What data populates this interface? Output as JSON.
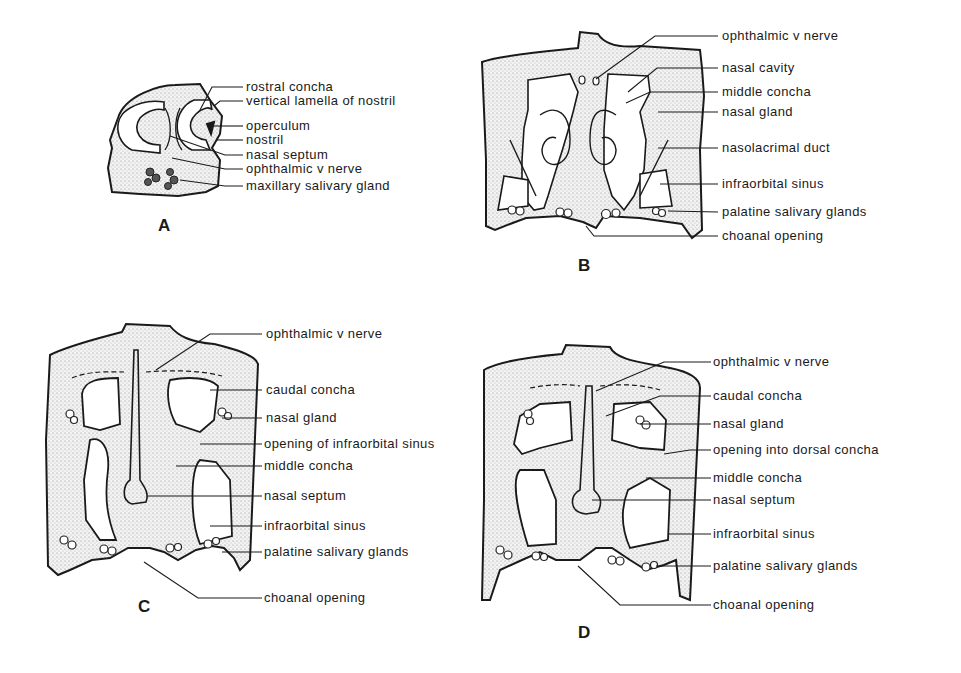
{
  "figure": {
    "panels": [
      {
        "id": "A",
        "letter": "A",
        "labels": [
          "rostral concha",
          "vertical lamella of nostril",
          "operculum",
          "nostril",
          "nasal septum",
          "ophthalmic v nerve",
          "maxillary salivary gland"
        ]
      },
      {
        "id": "B",
        "letter": "B",
        "labels": [
          "ophthalmic v nerve",
          "nasal cavity",
          "middle concha",
          "nasal gland",
          "nasolacrimal duct",
          "infraorbital sinus",
          "palatine salivary glands",
          "choanal opening"
        ]
      },
      {
        "id": "C",
        "letter": "C",
        "labels": [
          "ophthalmic v nerve",
          "caudal concha",
          "nasal gland",
          "opening of infraorbital sinus",
          "middle concha",
          "nasal septum",
          "infraorbital sinus",
          "palatine salivary glands",
          "choanal opening"
        ]
      },
      {
        "id": "D",
        "letter": "D",
        "labels": [
          "ophthalmic v nerve",
          "caudal concha",
          "nasal gland",
          "opening into dorsal concha",
          "middle concha",
          "nasal septum",
          "infraorbital sinus",
          "palatine salivary glands",
          "choanal opening"
        ]
      }
    ],
    "colors": {
      "ink": "#1a1a1a",
      "stipple_bg": "#f1f1f1",
      "stipple_dot": "#9a9a9a"
    }
  }
}
